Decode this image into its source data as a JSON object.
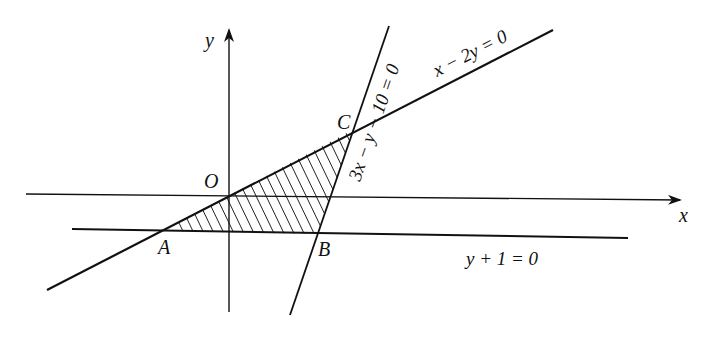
{
  "figure": {
    "type": "linear-programming-feasible-region",
    "axes": {
      "x_label": "x",
      "y_label": "y"
    },
    "points": [
      {
        "name": "O",
        "label": "O"
      },
      {
        "name": "A",
        "label": "A"
      },
      {
        "name": "B",
        "label": "B"
      },
      {
        "name": "C",
        "label": "C"
      }
    ],
    "lines": [
      {
        "name": "line-x-minus-2y",
        "equation": "x − 2y = 0"
      },
      {
        "name": "line-3x-minus-y-minus-10",
        "equation": "3x − y − 10 = 0"
      },
      {
        "name": "line-y-plus-1",
        "equation": "y + 1 = 0"
      }
    ],
    "shaded_region": "triangle ABC (hatched)",
    "colors": {
      "ink": "#111111",
      "background": "#ffffff"
    }
  }
}
